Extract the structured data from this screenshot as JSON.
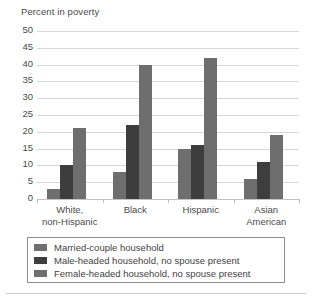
{
  "chart_data": {
    "type": "bar",
    "title": "",
    "ylabel": "Percent in poverty",
    "xlabel": "",
    "categories": [
      "White, non-Hispanic",
      "Black",
      "Hispanic",
      "Asian American"
    ],
    "category_lines": [
      [
        "White,",
        "non-Hispanic"
      ],
      [
        "Black"
      ],
      [
        "Hispanic"
      ],
      [
        "Asian",
        "American"
      ]
    ],
    "series": [
      {
        "name": "Married-couple household",
        "color": "#6e6e6e",
        "values": [
          3,
          8,
          15,
          6
        ]
      },
      {
        "name": "Male-headed household, no spouse present",
        "color": "#3d3d3d",
        "values": [
          10,
          22,
          16,
          11
        ]
      },
      {
        "name": "Female-headed household, no spouse present",
        "color": "#6e6e6e",
        "values": [
          21,
          40,
          42,
          19
        ]
      }
    ],
    "ylim": [
      0,
      50
    ],
    "yticks": [
      50,
      45,
      40,
      35,
      30,
      25,
      20,
      15,
      10,
      5,
      0
    ],
    "ytick_labels": [
      "50",
      "45",
      "40",
      "35",
      "30",
      "25",
      "20",
      "15",
      "10",
      "5",
      "0"
    ],
    "grid": true,
    "grid_color": "#d7d7d7",
    "legend_position": "bottom",
    "legend_border_color": "#8d8d8d",
    "background": "#ffffff",
    "text_color": "#4a4a4a"
  }
}
